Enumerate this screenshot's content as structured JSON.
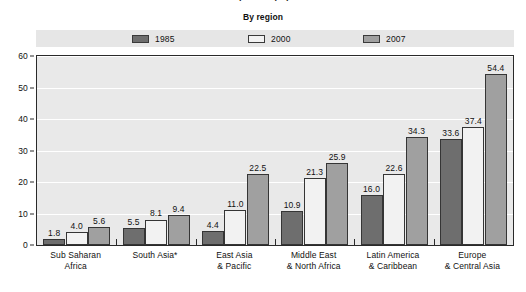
{
  "header": {
    "clipped_title": "Access per 100 population",
    "subtitle": "By region"
  },
  "legend": {
    "position": "top",
    "items": [
      {
        "label": "1985",
        "color": "#6e6e6e",
        "swatch": "legend-swatch-1985"
      },
      {
        "label": "2000",
        "color": "#f2f2f2",
        "swatch": "legend-swatch-2000"
      },
      {
        "label": "2007",
        "color": "#a0a0a0",
        "swatch": "legend-swatch-2007"
      }
    ]
  },
  "chart_data": {
    "type": "bar",
    "title": "Access per 100 population",
    "subtitle": "By region",
    "xlabel": "",
    "ylabel": "",
    "ylim": [
      0,
      60
    ],
    "yticks": [
      0,
      10,
      20,
      30,
      40,
      50,
      60
    ],
    "grid": true,
    "legend_position": "top",
    "categories": [
      "Sub Saharan Africa",
      "South Asia*",
      "East Asia & Pacific",
      "Middle East & North Africa",
      "Latin America & Caribbean",
      "Europe & Central Asia"
    ],
    "category_lines": [
      [
        "Sub Saharan",
        "Africa"
      ],
      [
        "South Asia*"
      ],
      [
        "East Asia",
        "& Pacific"
      ],
      [
        "Middle East",
        "& North Africa"
      ],
      [
        "Latin America",
        "& Caribbean"
      ],
      [
        "Europe",
        "& Central Asia"
      ]
    ],
    "series": [
      {
        "name": "1985",
        "color": "#6e6e6e",
        "values": [
          1.8,
          5.5,
          4.4,
          10.9,
          16.0,
          33.6
        ],
        "labels": [
          "1.8",
          "5.5",
          "4.4",
          "10.9",
          "16.0",
          "33.6"
        ]
      },
      {
        "name": "2000",
        "color": "#f2f2f2",
        "values": [
          4.0,
          8.1,
          11.0,
          21.3,
          22.6,
          37.4
        ],
        "labels": [
          "4.0",
          "8.1",
          "11.0",
          "21.3",
          "22.6",
          "37.4"
        ]
      },
      {
        "name": "2007",
        "color": "#a0a0a0",
        "values": [
          5.6,
          9.4,
          22.5,
          25.9,
          34.3,
          54.4
        ],
        "labels": [
          "5.6",
          "9.4",
          "22.5",
          "25.9",
          "34.3",
          "54.4"
        ]
      }
    ]
  },
  "colors": {
    "plot_background": "#e9e9e9",
    "gridline": "#ffffff",
    "axis": "#2a2a2a",
    "legend_strip": "#e6e6e6",
    "text": "#111111"
  }
}
